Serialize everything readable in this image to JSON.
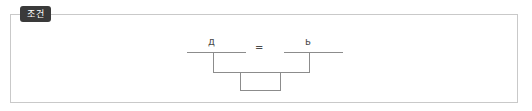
{
  "frame": {
    "tag_label": "조건",
    "border_color": "#c9c9c9",
    "background_color": "#ffffff",
    "tag_background_color": "#3a3a3a",
    "tag_text_color": "#ffffff"
  },
  "diagram": {
    "stroke_color": "#8c8c8c",
    "left_label": "д",
    "operator_label": "=",
    "right_label": "ь"
  }
}
